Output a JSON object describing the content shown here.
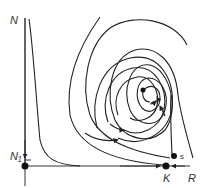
{
  "diagram": {
    "type": "phase-portrait",
    "axes": {
      "y_label": "N",
      "x_label": "R"
    },
    "points": [
      {
        "id": "N1",
        "label": "N₁",
        "kind": "equilibrium-origin"
      },
      {
        "id": "K",
        "label": "K",
        "kind": "equilibrium-axis"
      },
      {
        "id": "s",
        "label": "s",
        "kind": "saddle-start"
      },
      {
        "id": "center",
        "label": "",
        "kind": "stable-focus"
      }
    ],
    "colors": {
      "line": "#222222",
      "background": "#ffffff"
    }
  }
}
